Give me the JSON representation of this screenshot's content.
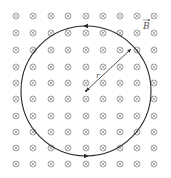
{
  "diagram": {
    "field_symbol": "cross-into-page",
    "field_label": "B",
    "radius_label": "r",
    "loop_direction": "counterclockwise",
    "grid": {
      "columns": [
        16,
        33,
        51,
        68,
        86,
        103,
        120,
        137,
        154
      ],
      "rows": [
        16,
        33,
        50,
        67,
        83,
        99,
        116,
        132,
        148,
        164
      ]
    },
    "circle": {
      "cx": 86,
      "cy": 91,
      "r": 65
    },
    "radius_end": {
      "x": 131,
      "y": 49
    },
    "colors": {
      "symbol": "#8a8a8a",
      "line": "#2a2a2a",
      "label": "#555555"
    }
  }
}
